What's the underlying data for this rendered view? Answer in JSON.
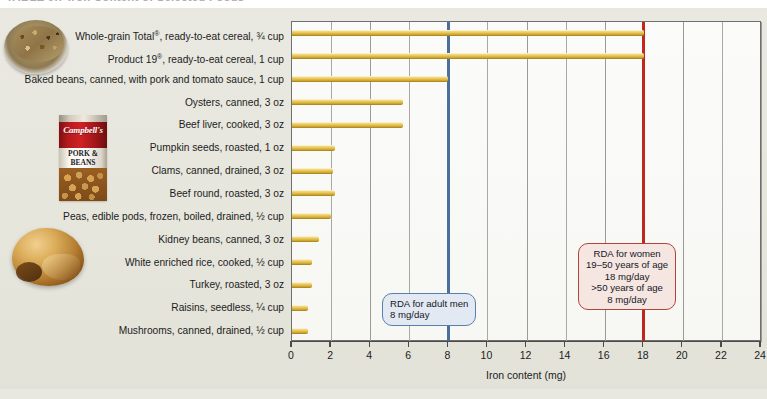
{
  "figure": {
    "title": "TABLE 9.7   Iron Content of Selected Foods",
    "photos": [
      {
        "name": "cereal-bowl-photo",
        "caption": "bowl of whole-grain cereal"
      },
      {
        "name": "pork-and-beans-can-photo",
        "brand": "Campbell's",
        "label_line1": "PORK &",
        "label_line2": "BEANS"
      },
      {
        "name": "roast-turkey-photo",
        "caption": "roasted turkey"
      }
    ]
  },
  "chart_data": {
    "type": "bar",
    "orientation": "horizontal",
    "title": "Iron Content of Selected Foods",
    "xlabel": "Iron content (mg)",
    "ylabel": "",
    "xlim": [
      0,
      24
    ],
    "xticks": [
      0,
      2,
      4,
      6,
      8,
      10,
      12,
      14,
      16,
      18,
      20,
      22,
      24
    ],
    "grid": "vertical",
    "legend": "none",
    "bar_color": "#e6c455",
    "categories": [
      "Whole-grain Total®, ready-to-eat cereal, ¾ cup",
      "Product 19®, ready-to-eat cereal, 1 cup",
      "Baked beans, canned, with pork and tomato sauce, 1 cup",
      "Oysters, canned, 3 oz",
      "Beef liver, cooked, 3 oz",
      "Pumpkin seeds, roasted, 1 oz",
      "Clams, canned, drained, 3 oz",
      "Beef round, roasted, 3 oz",
      "Peas, edible pods, frozen, boiled, drained, ½ cup",
      "Kidney beans, canned, 3 oz",
      "White enriched rice, cooked, ½ cup",
      "Turkey, roasted, 3 oz",
      "Raisins, seedless, ¼ cup",
      "Mushrooms, canned, drained, ½ cup"
    ],
    "values": [
      18.0,
      18.0,
      8.0,
      5.7,
      5.7,
      2.2,
      2.1,
      2.2,
      2.0,
      1.4,
      1.0,
      1.0,
      0.8,
      0.8
    ],
    "annotations": [
      {
        "name": "rda-men",
        "value": 8,
        "color": "#4a6f9c",
        "lines": [
          "RDA for adult men",
          "8 mg/day"
        ]
      },
      {
        "name": "rda-women",
        "value": 18,
        "color": "#c0281f",
        "lines": [
          "RDA for women",
          "19–50 years of age",
          "18 mg/day",
          ">50 years of age",
          "8 mg/day"
        ]
      }
    ]
  }
}
